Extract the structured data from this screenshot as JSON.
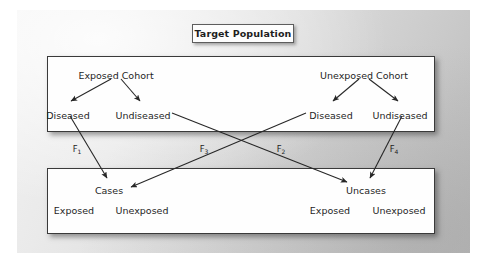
{
  "figure": {
    "title": "Target Population",
    "top_panel": {
      "cohorts": [
        {
          "name": "Exposed Cohort",
          "outcomes": [
            {
              "label": "Diseased"
            },
            {
              "label": "Undiseased"
            }
          ]
        },
        {
          "name": "Unexposed Cohort",
          "outcomes": [
            {
              "label": "Diseased"
            },
            {
              "label": "Undiseased"
            }
          ]
        }
      ]
    },
    "flow_labels": [
      {
        "base": "F",
        "sub": "1"
      },
      {
        "base": "F",
        "sub": "3"
      },
      {
        "base": "F",
        "sub": "2"
      },
      {
        "base": "F",
        "sub": "4"
      }
    ],
    "bottom_panel": {
      "groups": [
        {
          "name": "Cases",
          "strata": [
            {
              "label": "Exposed"
            },
            {
              "label": "Unexposed"
            }
          ]
        },
        {
          "name": "Uncases",
          "strata": [
            {
              "label": "Exposed"
            },
            {
              "label": "Unexposed"
            }
          ]
        }
      ]
    },
    "colors": {
      "ink": "#1e1e1e",
      "panel_border": "#3a3a3a",
      "panel_fill": "#fefefe",
      "backdrop_light": "#f2f2f2",
      "backdrop_dark": "#bdbdbd",
      "arrow": "#272727"
    }
  }
}
